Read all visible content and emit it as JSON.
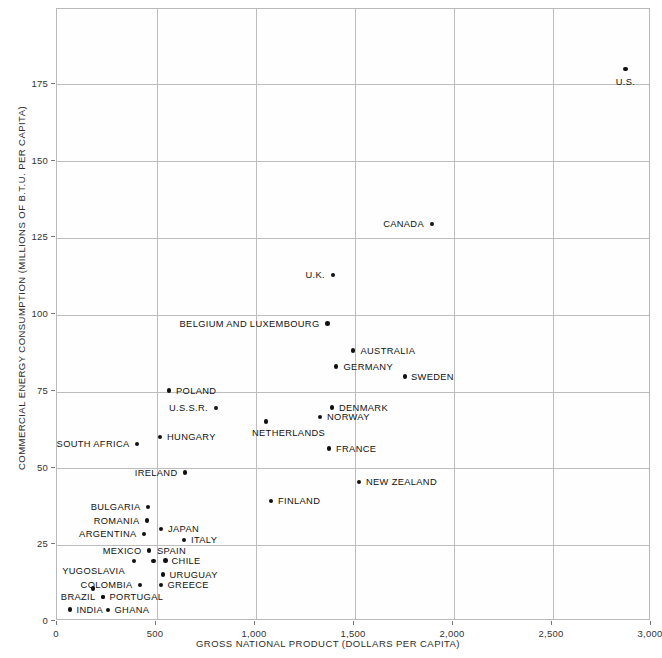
{
  "chart_data": {
    "type": "scatter",
    "title": "",
    "xlabel": "GROSS NATIONAL PRODUCT (DOLLARS PER CAPITA)",
    "ylabel": "COMMERCIAL ENERGY CONSUMPTION (MILLIONS OF B.T.U. PER CAPITA)",
    "xlim": [
      0,
      3000
    ],
    "ylim": [
      0,
      190
    ],
    "xticks": [
      0,
      500,
      1000,
      1500,
      2000,
      2500,
      3000
    ],
    "xticklabels": [
      "0",
      "500",
      "1,000",
      "1,500",
      "2,000",
      "2,500",
      "3,000"
    ],
    "yticks": [
      0,
      25,
      50,
      75,
      100,
      125,
      150,
      175
    ],
    "yticklabels": [
      "0",
      "25",
      "50",
      "75",
      "100",
      "125",
      "150",
      "175"
    ],
    "grid": true,
    "legend": "none",
    "marker_color": "#111111",
    "grid_color": "#bdbdbd",
    "points": [
      {
        "label": "U.S.",
        "x": 2880,
        "y": 179,
        "side": "below"
      },
      {
        "label": "CANADA",
        "x": 1900,
        "y": 128,
        "side": "left"
      },
      {
        "label": "U.K.",
        "x": 1400,
        "y": 112,
        "side": "left"
      },
      {
        "label": "BELGIUM AND LUXEMBOURG",
        "x": 1370,
        "y": 96,
        "side": "left"
      },
      {
        "label": "AUSTRALIA",
        "x": 1500,
        "y": 88,
        "side": "right"
      },
      {
        "label": "GERMANY",
        "x": 1415,
        "y": 82,
        "side": "right"
      },
      {
        "label": "SWEDEN",
        "x": 1765,
        "y": 78,
        "side": "right"
      },
      {
        "label": "POLAND",
        "x": 570,
        "y": 77,
        "side": "right"
      },
      {
        "label": "U.S.S.R.",
        "x": 810,
        "y": 69,
        "side": "left"
      },
      {
        "label": "DENMARK",
        "x": 1395,
        "y": 69,
        "side": "right"
      },
      {
        "label": "NORWAY",
        "x": 1335,
        "y": 66,
        "side": "right"
      },
      {
        "label": "NETHERLANDS",
        "x": 1060,
        "y": 64,
        "side": "below"
      },
      {
        "label": "HUNGARY",
        "x": 525,
        "y": 59,
        "side": "right"
      },
      {
        "label": "SOUTH AFRICA",
        "x": 410,
        "y": 57,
        "side": "left"
      },
      {
        "label": "FRANCE",
        "x": 1380,
        "y": 55,
        "side": "right"
      },
      {
        "label": "IRELAND",
        "x": 650,
        "y": 48,
        "side": "left"
      },
      {
        "label": "NEW ZEALAND",
        "x": 1530,
        "y": 45,
        "side": "right"
      },
      {
        "label": "FINLAND",
        "x": 1085,
        "y": 39,
        "side": "right"
      },
      {
        "label": "BULGARIA",
        "x": 465,
        "y": 36,
        "side": "left"
      },
      {
        "label": "ROMANIA",
        "x": 460,
        "y": 32,
        "side": "left"
      },
      {
        "label": "JAPAN",
        "x": 530,
        "y": 29,
        "side": "right"
      },
      {
        "label": "ARGENTINA",
        "x": 445,
        "y": 28,
        "side": "left"
      },
      {
        "label": "ITALY",
        "x": 645,
        "y": 26,
        "side": "right"
      },
      {
        "label": "MEXICO",
        "x": 470,
        "y": 24,
        "side": "left"
      },
      {
        "label": "SPAIN",
        "x": 500,
        "y": 24,
        "side": "right"
      },
      {
        "label": "CHILE",
        "x": 545,
        "y": 21,
        "side": "right"
      },
      {
        "label": "YUGOSLAVIA",
        "x": 400,
        "y": 21,
        "side": "above"
      },
      {
        "label": "URUGUAY",
        "x": 540,
        "y": 17,
        "side": "right"
      },
      {
        "label": "COLOMBIA",
        "x": 420,
        "y": 14,
        "side": "left"
      },
      {
        "label": "GREECE",
        "x": 530,
        "y": 14,
        "side": "right"
      },
      {
        "label": "BRAZIL",
        "x": 240,
        "y": 10,
        "side": "span"
      },
      {
        "label": "PORTUGAL",
        "x": 240,
        "y": 10,
        "side": "right"
      },
      {
        "label": "INDIA",
        "x": 70,
        "y": 6,
        "side": "right"
      },
      {
        "label": "GHANA",
        "x": 265,
        "y": 6,
        "side": "right"
      }
    ]
  },
  "plot": {
    "points": [
      {
        "name": "us",
        "label": "U.S.",
        "px": 625.5,
        "py": 69.0,
        "lx": 625.5,
        "ly": 82.0,
        "align": "center"
      },
      {
        "name": "canada",
        "label": "CANADA",
        "px": 432.0,
        "py": 224.0,
        "lx": 424.0,
        "ly": 224.0,
        "align": "left"
      },
      {
        "name": "uk",
        "label": "U.K.",
        "px": 333.0,
        "py": 275.0,
        "lx": 325.0,
        "ly": 275.0,
        "align": "left"
      },
      {
        "name": "belgium",
        "label": "BELGIUM AND LUXEMBOURG",
        "px": 327.5,
        "py": 323.5,
        "lx": 319.5,
        "ly": 323.5,
        "align": "left"
      },
      {
        "name": "australia",
        "label": "AUSTRALIA",
        "px": 353.0,
        "py": 350.5,
        "lx": 360.5,
        "ly": 350.5,
        "align": "right"
      },
      {
        "name": "germany",
        "label": "GERMANY",
        "px": 336.0,
        "py": 366.5,
        "lx": 343.5,
        "ly": 366.5,
        "align": "right"
      },
      {
        "name": "sweden",
        "label": "SWEDEN",
        "px": 405.0,
        "py": 376.5,
        "lx": 411.0,
        "ly": 376.5,
        "align": "right"
      },
      {
        "name": "poland",
        "label": "POLAND",
        "px": 169.0,
        "py": 390.5,
        "lx": 176.0,
        "ly": 390.5,
        "align": "right"
      },
      {
        "name": "ussr",
        "label": "U.S.S.R.",
        "px": 216.0,
        "py": 408.0,
        "lx": 208.0,
        "ly": 408.0,
        "align": "left"
      },
      {
        "name": "denmark",
        "label": "DENMARK",
        "px": 332.0,
        "py": 407.5,
        "lx": 339.0,
        "ly": 407.5,
        "align": "right"
      },
      {
        "name": "norway",
        "label": "NORWAY",
        "px": 320.0,
        "py": 417.0,
        "lx": 327.0,
        "ly": 417.0,
        "align": "right"
      },
      {
        "name": "netherlands",
        "label": "NETHERLANDS",
        "px": 266.0,
        "py": 421.5,
        "lx": 252.0,
        "ly": 432.5,
        "align": "right"
      },
      {
        "name": "hungary",
        "label": "HUNGARY",
        "px": 160.0,
        "py": 437.0,
        "lx": 167.0,
        "ly": 437.0,
        "align": "right"
      },
      {
        "name": "south-africa",
        "label": "SOUTH AFRICA",
        "px": 137.0,
        "py": 444.0,
        "lx": 129.5,
        "ly": 444.0,
        "align": "left"
      },
      {
        "name": "france",
        "label": "FRANCE",
        "px": 329.0,
        "py": 448.5,
        "lx": 336.0,
        "ly": 448.5,
        "align": "right"
      },
      {
        "name": "ireland",
        "label": "IRELAND",
        "px": 185.0,
        "py": 472.5,
        "lx": 177.5,
        "ly": 472.5,
        "align": "left"
      },
      {
        "name": "new-zealand",
        "label": "NEW ZEALAND",
        "px": 359.0,
        "py": 482.0,
        "lx": 366.0,
        "ly": 482.0,
        "align": "right"
      },
      {
        "name": "finland",
        "label": "FINLAND",
        "px": 271.0,
        "py": 501.0,
        "lx": 278.0,
        "ly": 501.0,
        "align": "right"
      },
      {
        "name": "bulgaria",
        "label": "BULGARIA",
        "px": 148.0,
        "py": 507.0,
        "lx": 140.5,
        "ly": 507.0,
        "align": "left"
      },
      {
        "name": "romania",
        "label": "ROMANIA",
        "px": 147.0,
        "py": 520.5,
        "lx": 139.5,
        "ly": 520.5,
        "align": "left"
      },
      {
        "name": "japan",
        "label": "JAPAN",
        "px": 161.0,
        "py": 529.0,
        "lx": 168.0,
        "ly": 529.0,
        "align": "right"
      },
      {
        "name": "argentina",
        "label": "ARGENTINA",
        "px": 144.0,
        "py": 534.0,
        "lx": 136.5,
        "ly": 534.0,
        "align": "left"
      },
      {
        "name": "italy",
        "label": "ITALY",
        "px": 184.0,
        "py": 540.0,
        "lx": 191.0,
        "ly": 540.0,
        "align": "right"
      },
      {
        "name": "mexico",
        "label": "MEXICO",
        "px": 149.0,
        "py": 550.5,
        "lx": 141.5,
        "ly": 550.5,
        "align": "left"
      },
      {
        "name": "spain",
        "label": "SPAIN",
        "px": 153.5,
        "py": 561.0,
        "lx": 157.0,
        "ly": 550.5,
        "align": "right"
      },
      {
        "name": "chile",
        "label": "CHILE",
        "px": 165.5,
        "py": 560.5,
        "lx": 171.5,
        "ly": 560.5,
        "align": "right"
      },
      {
        "name": "yugoslavia",
        "label": "YUGOSLAVIA",
        "px": 134.0,
        "py": 561.0,
        "lx": 125.0,
        "ly": 571.0,
        "align": "left"
      },
      {
        "name": "uruguay",
        "label": "URUGUAY",
        "px": 163.0,
        "py": 574.5,
        "lx": 169.5,
        "ly": 574.5,
        "align": "right"
      },
      {
        "name": "colombia",
        "label": "COLOMBIA",
        "px": 140.0,
        "py": 585.0,
        "lx": 132.5,
        "ly": 585.0,
        "align": "left"
      },
      {
        "name": "greece",
        "label": "GREECE",
        "px": 161.0,
        "py": 585.0,
        "lx": 167.5,
        "ly": 585.0,
        "align": "right"
      },
      {
        "name": "brazil",
        "label": "BRAZIL",
        "px": 103.0,
        "py": 597.0,
        "lx": 95.5,
        "ly": 597.0,
        "align": "left"
      },
      {
        "name": "portugal",
        "label": "PORTUGAL",
        "px": 103.0,
        "py": 597.0,
        "lx": 109.5,
        "ly": 597.0,
        "align": "right"
      },
      {
        "name": "india",
        "label": "INDIA",
        "px": 70.0,
        "py": 609.5,
        "lx": 76.5,
        "ly": 609.5,
        "align": "right"
      },
      {
        "name": "ghana",
        "label": "GHANA",
        "px": 108.0,
        "py": 610.0,
        "lx": 114.5,
        "ly": 610.0,
        "align": "right"
      }
    ],
    "extra_dots": [
      {
        "name": "colombia-extra-dot",
        "px": 93.0,
        "py": 588.5
      }
    ],
    "xgrid_px": [
      155.5,
      254.5,
      353.5,
      452.5,
      551.5
    ],
    "ygrid_px": [
      83.0,
      159.5,
      236.5,
      313.5,
      390.5,
      467.0,
      543.5
    ],
    "frame": {
      "left": 56,
      "top": 8,
      "right": 650,
      "bottom": 620
    }
  }
}
